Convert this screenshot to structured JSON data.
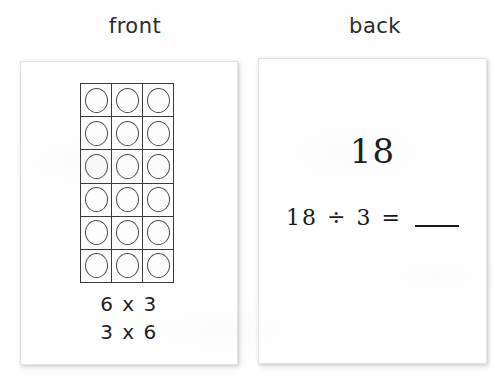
{
  "page": {
    "background_color": "#fefefe",
    "ink_color": "#1f1f1f"
  },
  "headings": {
    "front": "front",
    "back": "back"
  },
  "front_card": {
    "array": {
      "rows": 6,
      "columns": 3,
      "total_counters": 18,
      "counter_shape": "circle"
    },
    "facts": [
      "6 x 3",
      "3 x 6"
    ]
  },
  "back_card": {
    "answer": "18",
    "equation": {
      "dividend": "18",
      "operator": "÷",
      "divisor": "3",
      "equals": "=",
      "blank": "____"
    }
  }
}
